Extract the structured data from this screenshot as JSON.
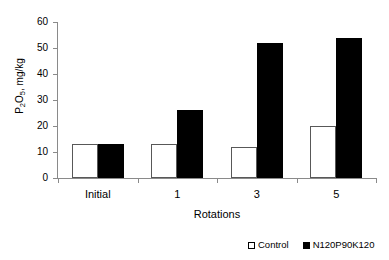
{
  "chart_data": {
    "type": "bar",
    "title": "",
    "xlabel": "Rotations",
    "ylabel": "P2O5, mg/kg",
    "ylabel_parts": {
      "base1": "P",
      "sub1": "2",
      "base2": "O",
      "sub2": "5",
      "tail": ", mg/kg"
    },
    "categories": [
      "Initial",
      "1",
      "3",
      "5"
    ],
    "series": [
      {
        "name": "Control",
        "values": [
          13,
          13,
          12,
          20
        ],
        "color": "#ffffff",
        "marker": "hollow-square"
      },
      {
        "name": "N120P90K120",
        "values": [
          13,
          26,
          52,
          54
        ],
        "color": "#000000",
        "marker": "solid-square"
      }
    ],
    "ylim": [
      0,
      60
    ],
    "yticks": [
      0,
      10,
      20,
      30,
      40,
      50,
      60
    ],
    "ytick_labels": [
      "0",
      "10",
      "20",
      "30",
      "40",
      "50",
      "60"
    ],
    "grid": false,
    "legend_position": "bottom-right"
  },
  "legend": {
    "items": [
      {
        "label": "Control",
        "marker": "hollow-square"
      },
      {
        "label": "N120P90K120",
        "marker": "solid-square"
      }
    ]
  }
}
